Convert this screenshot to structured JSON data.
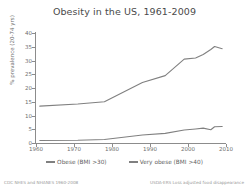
{
  "chart_data": {
    "type": "line",
    "title": "Obesity in the US, 1961-2009",
    "xlabel": "",
    "ylabel": "% prevalence (20-74 yrs)",
    "xlim": [
      1960,
      2010
    ],
    "ylim": [
      0,
      40
    ],
    "grid": false,
    "legend_position": "bottom",
    "x_ticks": [
      1960,
      1970,
      1980,
      1990,
      2000,
      2010
    ],
    "y_ticks": [
      0,
      5,
      10,
      15,
      20,
      25,
      30,
      35,
      40
    ],
    "series": [
      {
        "name": "Obese (BMI >30)",
        "color": "#808080",
        "x": [
          1961,
          1971,
          1978,
          1988,
          1994,
          1999,
          2002,
          2004,
          2006,
          2007,
          2009
        ],
        "values": [
          13.4,
          14.2,
          15.0,
          22.0,
          24.5,
          30.5,
          30.9,
          32.2,
          34.0,
          35.1,
          34.3
        ]
      },
      {
        "name": "Very obese (BMI >40)",
        "color": "#808080",
        "x": [
          1961,
          1971,
          1978,
          1988,
          1994,
          1999,
          2002,
          2004,
          2006,
          2007,
          2009
        ],
        "values": [
          0.9,
          1.0,
          1.3,
          2.9,
          3.5,
          4.7,
          5.1,
          5.4,
          4.8,
          5.9,
          6.0
        ]
      }
    ],
    "annotations": {
      "source_left": "CDC NHES and NHANES 1960-2008",
      "source_right": "USDA-ERS Loss adjusted food disappearance"
    }
  }
}
